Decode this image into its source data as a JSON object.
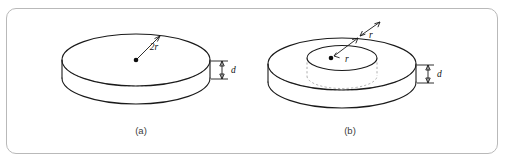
{
  "figure": {
    "type": "technical-line-diagram",
    "background_color": "#ffffff",
    "frame": {
      "border_color": "#b9b9b9",
      "style": "rounded-rectangle"
    },
    "line_color": "#1a1a1a",
    "hidden_line_color": "#9a9a9a",
    "panels": [
      {
        "id": "a",
        "caption": "(a)",
        "shape": "solid cylindrical disk",
        "labels": [
          {
            "name": "diameter-label",
            "text": "2r"
          },
          {
            "name": "thickness-label",
            "text": "d"
          }
        ]
      },
      {
        "id": "b",
        "caption": "(b)",
        "shape": "annular disk with central hole",
        "labels": [
          {
            "name": "inner-radius-label",
            "text": "r"
          },
          {
            "name": "ring-width-label",
            "text": "r"
          },
          {
            "name": "thickness-label",
            "text": "d"
          }
        ]
      }
    ]
  }
}
